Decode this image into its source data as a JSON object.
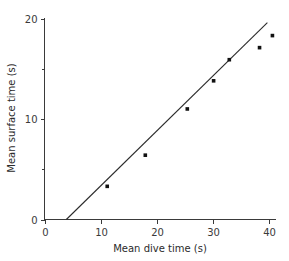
{
  "chart_data": {
    "type": "scatter",
    "title": "",
    "xlabel": "Mean dive time (s)",
    "ylabel": "Mean surface time (s)",
    "xlim": [
      0,
      42
    ],
    "ylim": [
      0,
      20
    ],
    "xticks": [
      0,
      10,
      20,
      30,
      40
    ],
    "xtick_labels": [
      "0",
      "10",
      "20",
      "30",
      "40"
    ],
    "yticks": [
      0,
      10,
      20
    ],
    "ytick_labels": [
      "0",
      "10",
      "20"
    ],
    "yminor_ticks": [
      5,
      15
    ],
    "grid": false,
    "legend": null,
    "marker": "square",
    "marker_color": "#111111",
    "axis_color": "#3a3a3a",
    "line_color": "#2b2b2b",
    "points": [
      {
        "x": 11.2,
        "y": 3.3
      },
      {
        "x": 18.0,
        "y": 6.4
      },
      {
        "x": 25.5,
        "y": 11.0
      },
      {
        "x": 30.2,
        "y": 13.8
      },
      {
        "x": 33.0,
        "y": 15.9
      },
      {
        "x": 38.4,
        "y": 17.1
      },
      {
        "x": 40.7,
        "y": 18.3
      }
    ],
    "fit_line": {
      "label": "",
      "x_start": 3.9,
      "y_start": 0.0,
      "x_end": 39.8,
      "y_end": 19.6
    }
  }
}
